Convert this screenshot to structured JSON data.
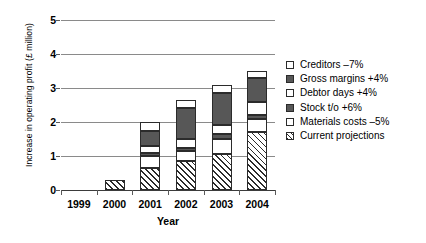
{
  "chart_data": {
    "type": "bar",
    "stacked": true,
    "title": "",
    "xlabel": "Year",
    "ylabel": "Increase in operating profit (£ million)",
    "categories": [
      "1999",
      "2000",
      "2001",
      "2002",
      "2003",
      "2004"
    ],
    "ylim": [
      0,
      5
    ],
    "yticks": [
      0,
      1,
      2,
      3,
      4,
      5
    ],
    "ytick_labels": [
      "0",
      "1",
      "2",
      "3",
      "4",
      "5"
    ],
    "grid": true,
    "grid_axis": "y",
    "legend_position": "right",
    "legend_order_top_to_bottom": [
      "Creditors –7%",
      "Gross margins +4%",
      "Debtor days +4%",
      "Stock t/o +6%",
      "Materials costs –5%",
      "Current projections"
    ],
    "series": [
      {
        "name": "Current projections",
        "fill": "hatch",
        "values": [
          0,
          0.3,
          0.65,
          0.85,
          1.05,
          1.7
        ]
      },
      {
        "name": "Materials costs –5%",
        "fill": "white",
        "values": [
          0,
          0,
          0.35,
          0.3,
          0.45,
          0.4
        ]
      },
      {
        "name": "Stock t/o +6%",
        "fill": "dark",
        "values": [
          0,
          0,
          0.1,
          0.1,
          0.15,
          0.1
        ]
      },
      {
        "name": "Debtor days +4%",
        "fill": "white",
        "values": [
          0,
          0,
          0.2,
          0.25,
          0.25,
          0.4
        ]
      },
      {
        "name": "Gross margins +4%",
        "fill": "dark",
        "values": [
          0,
          0,
          0.45,
          0.9,
          0.95,
          0.7
        ]
      },
      {
        "name": "Creditors –7%",
        "fill": "white",
        "values": [
          0,
          0,
          0.25,
          0.25,
          0.25,
          0.2
        ]
      }
    ],
    "totals": [
      0,
      0.3,
      2.0,
      2.65,
      3.1,
      3.5
    ],
    "colors": {
      "dark": "#575757",
      "white": "#ffffff",
      "outline": "#2b2b2b",
      "gridline": "#8a8a8a",
      "axis": "#3b3b3b"
    }
  },
  "axes": {
    "y_title": "Increase in operating profit (£ million)",
    "x_title": "Year"
  },
  "legend": {
    "items": [
      {
        "label": "Creditors –7%",
        "fill": "white"
      },
      {
        "label": "Gross margins +4%",
        "fill": "dark"
      },
      {
        "label": "Debtor days +4%",
        "fill": "white"
      },
      {
        "label": "Stock t/o +6%",
        "fill": "dark"
      },
      {
        "label": "Materials costs –5%",
        "fill": "white"
      },
      {
        "label": "Current projections",
        "fill": "hatch"
      }
    ]
  }
}
